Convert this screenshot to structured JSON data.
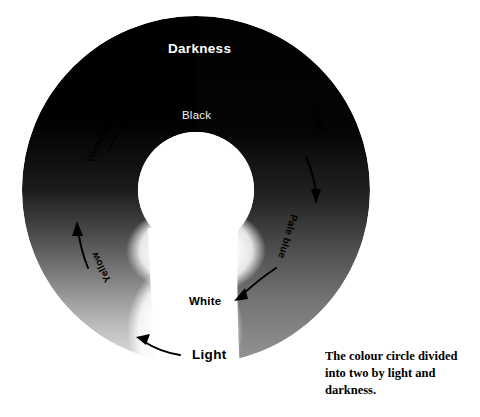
{
  "figure": {
    "title": "The colour circle divided into two by light and darkness",
    "background_color": "#ffffff",
    "caption": "The colour circle divided into two by light and darkness."
  },
  "wheel": {
    "center_x": 196,
    "center_y": 190,
    "outer_radius": 174,
    "inner_radius": 58,
    "dark_color": "#000000",
    "light_color": "#ffffff",
    "poles": {
      "darkness_label": "Darkness",
      "black_label": "Black",
      "white_label": "White",
      "light_label": "Light"
    },
    "hue_labels": [
      {
        "name": "violet",
        "text": "Violet",
        "angle_deg": 72
      },
      {
        "name": "pale-blue",
        "text": "Pale blue",
        "angle_deg": 107
      },
      {
        "name": "vermilion",
        "text": "Vermilion",
        "angle_deg": -64
      },
      {
        "name": "yellow",
        "text": "Yellow",
        "angle_deg": -116
      }
    ],
    "arrows": [
      {
        "name": "violet-to-pale-blue",
        "direction": "clockwise-down"
      },
      {
        "name": "pale-blue-to-white",
        "direction": "clockwise-down-left"
      },
      {
        "name": "light-to-yellow",
        "direction": "counterclockwise-up-left"
      },
      {
        "name": "yellow-to-vermilion",
        "direction": "counterclockwise-up"
      },
      {
        "name": "vermilion-to-black",
        "direction": "counterclockwise-up-right"
      }
    ]
  }
}
